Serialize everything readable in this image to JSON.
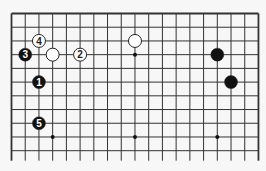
{
  "diagram": {
    "type": "go-board-fragment",
    "columns": 19,
    "visible_rows": 11,
    "edges": [
      "top",
      "left",
      "right"
    ],
    "hoshi": [
      [
        3,
        3
      ],
      [
        9,
        3
      ],
      [
        15,
        3
      ],
      [
        3,
        9
      ],
      [
        9,
        9
      ],
      [
        15,
        9
      ]
    ],
    "stones": [
      {
        "color": "white",
        "col": 2,
        "row": 2,
        "label": "4"
      },
      {
        "color": "white",
        "col": 3,
        "row": 3,
        "label": ""
      },
      {
        "color": "white",
        "col": 5,
        "row": 3,
        "label": "2"
      },
      {
        "color": "white",
        "col": 9,
        "row": 2,
        "label": ""
      },
      {
        "color": "black",
        "col": 1,
        "row": 3,
        "label": "3"
      },
      {
        "color": "black",
        "col": 2,
        "row": 5,
        "label": "1"
      },
      {
        "color": "black",
        "col": 2,
        "row": 8,
        "label": "5"
      },
      {
        "color": "black",
        "col": 15,
        "row": 3,
        "label": ""
      },
      {
        "color": "black",
        "col": 16,
        "row": 5,
        "label": ""
      }
    ],
    "colors": {
      "black": "#111111",
      "white": "#ffffff",
      "line": "#333333"
    }
  }
}
